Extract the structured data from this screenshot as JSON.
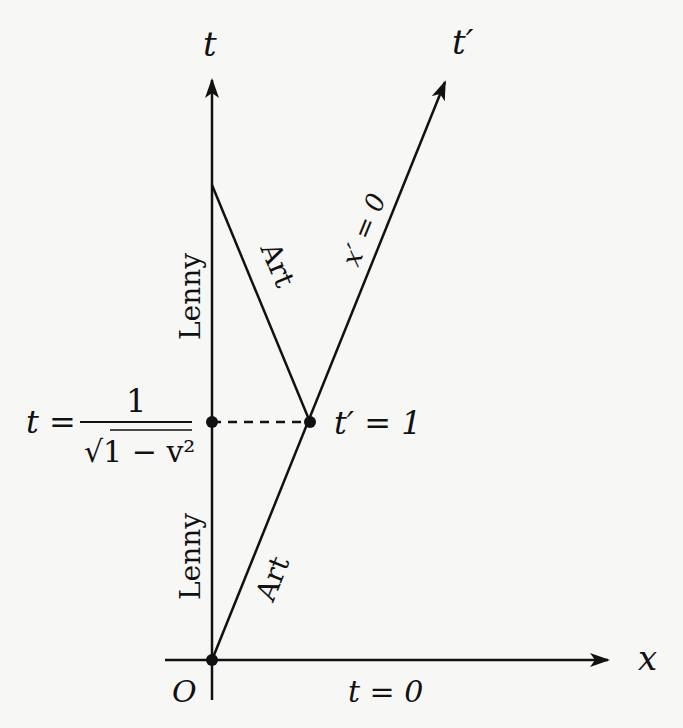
{
  "diagram": {
    "type": "spacetime-diagram",
    "axes": {
      "t_label": "t",
      "x_label": "x",
      "t_prime_label": "t′",
      "origin_label": "O"
    },
    "labels": {
      "x_prime_eq": "x′ = 0",
      "t_eq_0": "t = 0",
      "t_prime_eq_1": "t′ = 1",
      "t_formula_lhs": "t =",
      "t_formula_numerator": "1",
      "t_formula_denominator": "√1 − v²",
      "lenny_upper": "Lenny",
      "lenny_lower": "Lenny",
      "art_upper": "Art",
      "art_lower": "Art"
    },
    "colors": {
      "ink": "#111111",
      "background": "#f7f7f5"
    },
    "points": [
      {
        "name": "origin",
        "x": 212,
        "y": 660
      },
      {
        "name": "lenny-turn-event",
        "x": 212,
        "y": 422
      },
      {
        "name": "art-turnaround",
        "x": 310,
        "y": 422
      },
      {
        "name": "reunion",
        "x": 212,
        "y": 185
      }
    ]
  }
}
